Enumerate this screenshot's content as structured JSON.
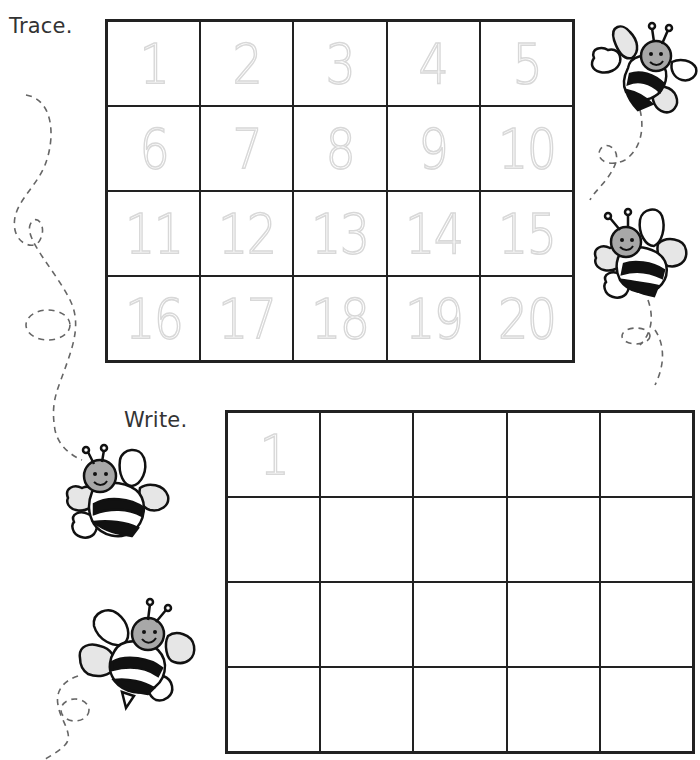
{
  "worksheet": {
    "trace_section": {
      "label": "Trace.",
      "rows": 4,
      "cols": 5,
      "numbers": [
        "1",
        "2",
        "3",
        "4",
        "5",
        "6",
        "7",
        "8",
        "9",
        "10",
        "11",
        "12",
        "13",
        "14",
        "15",
        "16",
        "17",
        "18",
        "19",
        "20"
      ]
    },
    "write_section": {
      "label": "Write.",
      "rows": 4,
      "cols": 5,
      "cells": [
        "1",
        "",
        "",
        "",
        "",
        "",
        "",
        "",
        "",
        "",
        "",
        "",
        "",
        "",
        "",
        "",
        "",
        "",
        "",
        ""
      ]
    },
    "decorations": {
      "icons": [
        "bee-icon",
        "bee-icon",
        "bee-icon",
        "bee-icon",
        "dashed-flight-path"
      ]
    },
    "colors": {
      "grid_line": "#222222",
      "trace_digit": "#d8d8d8",
      "bee_head": "#a8a8a8",
      "bee_wing": "#e6e6e6",
      "flight_path": "#666666"
    }
  }
}
